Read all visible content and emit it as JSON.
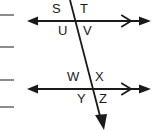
{
  "figure": {
    "canvas": {
      "width": 156,
      "height": 131,
      "background": "#ffffff"
    },
    "stroke_color": "#1a1a1a",
    "margin_marker_color": "#8c8c8c"
  },
  "margin_markers": [
    {
      "name": "margin-dash-1",
      "x": 0,
      "y": 14,
      "width": 14,
      "height": 2
    },
    {
      "name": "margin-dash-2",
      "x": 0,
      "y": 46,
      "width": 14,
      "height": 2
    },
    {
      "name": "margin-dash-3",
      "x": 0,
      "y": 79,
      "width": 14,
      "height": 2
    },
    {
      "name": "margin-dash-4",
      "x": 0,
      "y": 106,
      "width": 14,
      "height": 2
    }
  ],
  "lines": {
    "top_parallel": {
      "name": "top-parallel-line",
      "x1": 30,
      "y1": 21,
      "x2": 147,
      "y2": 21,
      "left_arrow": true,
      "right_arrow": true,
      "parallel_chevron_x": 127
    },
    "bottom_parallel": {
      "name": "bottom-parallel-line",
      "x1": 30,
      "y1": 89,
      "x2": 147,
      "y2": 89,
      "left_arrow": true,
      "right_arrow": true,
      "parallel_chevron_x": 127
    },
    "transversal": {
      "name": "transversal-line",
      "x1": 70,
      "y1": 0,
      "x2": 102,
      "y2": 125,
      "bottom_arrow": true
    }
  },
  "intersections": [
    {
      "name": "top-intersection",
      "x": 75,
      "y": 21
    },
    {
      "name": "bottom-intersection",
      "x": 92,
      "y": 89
    }
  ],
  "angle_labels": [
    {
      "id": "S",
      "text": "S",
      "x": 52,
      "y": 2,
      "position": "upper-left-of-top-intersection"
    },
    {
      "id": "T",
      "text": "T",
      "x": 80,
      "y": 2,
      "position": "upper-right-of-top-intersection"
    },
    {
      "id": "U",
      "text": "U",
      "x": 58,
      "y": 24,
      "position": "lower-left-of-top-intersection"
    },
    {
      "id": "V",
      "text": "V",
      "x": 83,
      "y": 24,
      "position": "lower-right-of-top-intersection"
    },
    {
      "id": "W",
      "text": "W",
      "x": 68,
      "y": 70,
      "position": "upper-left-of-bottom-intersection"
    },
    {
      "id": "X",
      "text": "X",
      "x": 95,
      "y": 70,
      "position": "upper-right-of-bottom-intersection"
    },
    {
      "id": "Y",
      "text": "Y",
      "x": 77,
      "y": 92,
      "position": "lower-left-of-bottom-intersection"
    },
    {
      "id": "Z",
      "text": "Z",
      "x": 99,
      "y": 92,
      "position": "lower-right-of-bottom-intersection"
    }
  ]
}
